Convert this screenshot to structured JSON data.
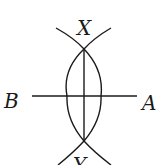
{
  "diagram": {
    "type": "perpendicular-bisector-construction",
    "labels": {
      "top": "X",
      "bottom": "Y",
      "left": "B",
      "right": "A"
    },
    "colors": {
      "stroke": "#1a1a1a",
      "background": "#ffffff"
    }
  }
}
